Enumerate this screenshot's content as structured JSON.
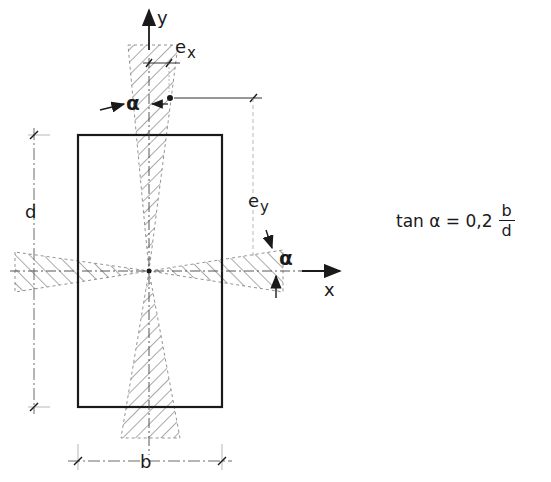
{
  "diagram": {
    "axes": {
      "x_label": "x",
      "y_label": "y"
    },
    "dimensions": {
      "width_label": "b",
      "depth_label": "d",
      "eccentricity_x": "e",
      "eccentricity_x_sub": "x",
      "eccentricity_y": "e",
      "eccentricity_y_sub": "y"
    },
    "angle_label": "α",
    "formula": {
      "lhs": "tan α = 0,2",
      "numerator": "b",
      "denominator": "d"
    },
    "colors": {
      "line": "#1a1a1a",
      "hatch": "#555555"
    }
  }
}
